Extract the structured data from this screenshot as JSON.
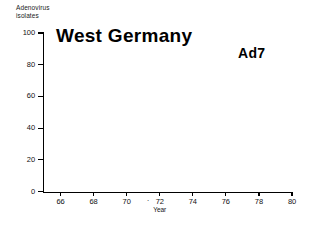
{
  "chart_data": {
    "type": "bar",
    "title": "West Germany",
    "xlabel": "Year",
    "ylabel": "Adenovirus isolates",
    "ylim": [
      0,
      100
    ],
    "xlim": [
      65,
      80
    ],
    "grid": false,
    "legend": "none",
    "stacked": true,
    "annotations": [
      {
        "text": "Ad7",
        "x": 78,
        "y": 93
      }
    ],
    "ytick_labels": [
      "0",
      "20",
      "40",
      "60",
      "80",
      "100"
    ],
    "ytick_values": [
      0,
      20,
      40,
      60,
      80,
      100
    ],
    "xtick_labels": [
      "66",
      "68",
      "70",
      "72",
      "74",
      "76",
      "78",
      "80"
    ],
    "xtick_values": [
      66,
      68,
      70,
      72,
      74,
      76,
      78,
      80
    ],
    "categories": [
      1966,
      1967,
      1968,
      1969,
      1970,
      1971,
      1972,
      1973,
      1974,
      1975,
      1976,
      1977,
      1978
    ],
    "series": [
      {
        "name": "hatched",
        "pattern": "cross-hatch",
        "values": [
          0,
          3,
          11,
          21,
          12,
          2,
          12,
          13,
          19,
          26,
          9,
          5,
          12
        ]
      },
      {
        "name": "open",
        "pattern": "white",
        "values": [
          0,
          29,
          9,
          13,
          14,
          34,
          29,
          77,
          55,
          12,
          0,
          6,
          78
        ]
      }
    ],
    "totals": [
      0,
      32,
      20,
      34,
      26,
      36,
      41,
      90,
      74,
      38,
      9,
      11,
      90
    ]
  },
  "axis": {
    "y_caption_line1": "Adenovirus",
    "y_caption_line2": "isolates"
  }
}
